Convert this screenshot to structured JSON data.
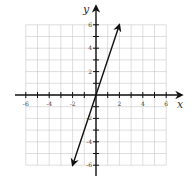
{
  "chart_data": {
    "type": "line",
    "title": "",
    "xlabel": "x",
    "ylabel": "y",
    "xlim": [
      -6,
      6
    ],
    "ylim": [
      -6,
      6
    ],
    "grid": true,
    "x_ticks": [
      -6,
      -4,
      -2,
      2,
      4,
      6
    ],
    "y_ticks": [
      -6,
      -4,
      -2,
      2,
      4,
      6
    ],
    "x_tick_labels": [
      "-6",
      "-4",
      "-2",
      "2",
      "4",
      "6"
    ],
    "y_tick_labels": [
      "-6",
      "-4",
      "-2",
      "2",
      "4",
      "6"
    ],
    "series": [
      {
        "name": "y = 3x",
        "x": [
          -2,
          2
        ],
        "y": [
          -6,
          6
        ],
        "arrows": "both"
      }
    ],
    "legend": null
  },
  "colors": {
    "grid": "#c8c8c8",
    "axis": "#111111",
    "line": "#111111"
  }
}
